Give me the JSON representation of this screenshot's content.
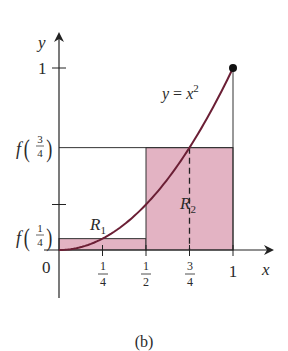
{
  "figure": {
    "caption": "(b)",
    "function_label": {
      "y": "y",
      "eq": " = ",
      "x": "x",
      "exp": "2"
    },
    "x_axis_label": "x",
    "y_axis_label": "y",
    "origin_label": "0",
    "y_tick_one": "1",
    "x_ticks": [
      {
        "value": 0.25,
        "num": "1",
        "den": "4"
      },
      {
        "value": 0.5,
        "num": "1",
        "den": "2"
      },
      {
        "value": 0.75,
        "num": "3",
        "den": "4"
      },
      {
        "value": 1,
        "label": "1"
      }
    ],
    "y_labels": [
      {
        "value": 0.0625,
        "f": "f",
        "num": "1",
        "den": "4"
      },
      {
        "value": 0.5625,
        "f": "f",
        "num": "3",
        "den": "4"
      }
    ],
    "regions": [
      {
        "name": "R",
        "sub": "1",
        "x0": 0,
        "x1": 0.5,
        "height": 0.0625
      },
      {
        "name": "R",
        "sub": "2",
        "x0": 0.5,
        "x1": 1,
        "height": 0.5625
      }
    ],
    "colors": {
      "curve": "#6b1f35",
      "fill": "#e3b3c3",
      "axis": "#222222",
      "endpoint": "#111111"
    }
  }
}
